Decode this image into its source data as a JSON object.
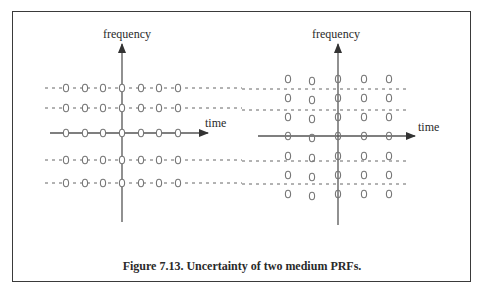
{
  "caption": "Figure 7.13. Uncertainty of two medium PRFs.",
  "colors": {
    "axis": "#555555",
    "marker": "#777777",
    "dash": "#666666",
    "text": "#2a2a2a",
    "border": "#3a3a3a"
  },
  "left_diagram": {
    "y_axis_label": "frequency",
    "x_axis_label": "time",
    "rows": [
      {
        "y": 88,
        "dashed": true
      },
      {
        "y": 108,
        "dashed": true
      },
      {
        "y": 133,
        "dashed": false,
        "is_time_axis": true
      },
      {
        "y": 160,
        "dashed": true
      },
      {
        "y": 183,
        "dashed": true
      }
    ],
    "marker_x": [
      66,
      85,
      103,
      122,
      141,
      159,
      178
    ]
  },
  "right_diagram": {
    "y_axis_label": "frequency",
    "x_axis_label": "time",
    "dashed_lines_y": [
      89,
      110,
      161,
      184
    ],
    "marker_rows_y": [
      79,
      98,
      117,
      136,
      156,
      175,
      194
    ],
    "marker_x": [
      288,
      312,
      338,
      364,
      389
    ]
  }
}
